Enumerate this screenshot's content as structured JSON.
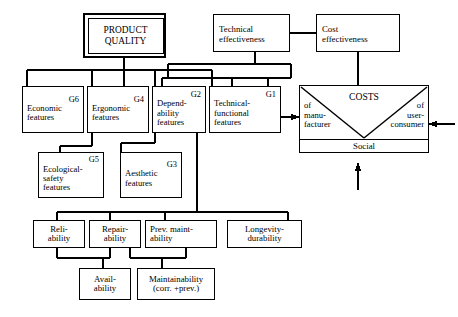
{
  "diagram": {
    "stroke_color": "#000000",
    "background_color": "#ffffff",
    "nodes": {
      "product_quality": {
        "label": "PRODUCT\nQUALITY"
      },
      "technical_effectiveness": {
        "label": "Technical\neffectiveness"
      },
      "cost_effectiveness": {
        "label": "Cost\neffectiveness"
      },
      "economic_features": {
        "code": "G6",
        "label": "Economic\nfeatures"
      },
      "ergonomic_features": {
        "code": "G4",
        "label": "Ergonomic\nfeatures"
      },
      "dependability_features": {
        "code": "G2",
        "label": "Depend-\nability\nfeatures"
      },
      "technical_functional_features": {
        "code": "G1",
        "label": "Technical-\nfunctional\nfeatures"
      },
      "ecological_safety_features": {
        "code": "G5",
        "label": "Ecological-\nsafety\nfeatures"
      },
      "aesthetic_features": {
        "code": "G3",
        "label": "Aesthetic\nfeatures"
      },
      "reliability": {
        "label": "Reli-\nability"
      },
      "repairability": {
        "label": "Repair-\nability"
      },
      "prev_maintability": {
        "label": "Prev. maint-\nability"
      },
      "longevity_durability": {
        "label": "Longevity-\ndurability"
      },
      "availability": {
        "label": "Avail-\nability"
      },
      "maintainability": {
        "label": "Maintainability\n(corr. +prev.)"
      },
      "costs": {
        "title": "COSTS",
        "left_label": "of\nmanu-\nfacturer",
        "right_label": "of\nuser-\nconsumer",
        "bottom_label": "Social"
      }
    }
  }
}
